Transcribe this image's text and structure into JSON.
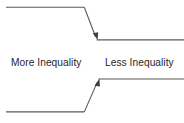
{
  "diagram": {
    "type": "convergence-flow-diagram",
    "background_color": "#ffffff",
    "line_color": "#595959",
    "arrow_color": "#3f3f3f",
    "text_color": "#1f1f1f",
    "labels": {
      "left": "More Inequality",
      "right": "Less Inequality"
    },
    "paths": [
      {
        "name": "upper-converging-path",
        "direction": "descending",
        "points": "6,7 84,7 96,38",
        "arrow_at": "96,39",
        "tail": "97,40 184,40"
      },
      {
        "name": "lower-converging-path",
        "direction": "ascending",
        "points": "6,112 84,112 98,80",
        "arrow_at": "98,79",
        "tail": "99,79 184,79"
      }
    ]
  }
}
